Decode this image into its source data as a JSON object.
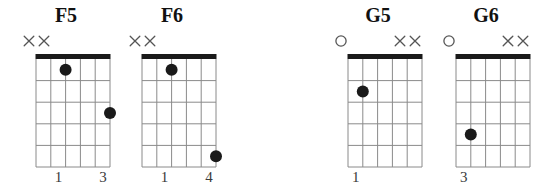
{
  "chart_data": {
    "type": "table",
    "instrument": "guitar",
    "string_count": 6,
    "fret_count": 5,
    "legend": {
      "x_marker": "string not played (muted)",
      "o_marker": "open string",
      "dot": "fretted note",
      "nut": "thick bar indicates open position nut"
    },
    "colors": {
      "nut": "#1a1a1a",
      "grid": "#8a8a8a",
      "dot": "#1a1a1a",
      "marker": "#555555",
      "title": "#111111",
      "background": "#ffffff"
    },
    "chords": [
      {
        "name": "F5",
        "markers": [
          "x",
          "x",
          "",
          "",
          "",
          ""
        ],
        "dots": [
          {
            "string": 3,
            "fret": 1
          },
          {
            "string": 6,
            "fret": 3
          }
        ],
        "fingers": [
          {
            "string": 3,
            "label": "1"
          },
          {
            "string": 6,
            "label": "3"
          }
        ]
      },
      {
        "name": "F6",
        "markers": [
          "x",
          "x",
          "",
          "",
          "",
          ""
        ],
        "dots": [
          {
            "string": 3,
            "fret": 1
          },
          {
            "string": 6,
            "fret": 5
          }
        ],
        "fingers": [
          {
            "string": 3,
            "label": "1"
          },
          {
            "string": 6,
            "label": "4"
          }
        ]
      },
      {
        "name": "G5",
        "markers": [
          "o",
          "",
          "",
          "",
          "x",
          "x"
        ],
        "dots": [
          {
            "string": 2,
            "fret": 2
          }
        ],
        "fingers": [
          {
            "string": 2,
            "label": "1"
          }
        ]
      },
      {
        "name": "G6",
        "markers": [
          "o",
          "",
          "",
          "",
          "x",
          "x"
        ],
        "dots": [
          {
            "string": 2,
            "fret": 4
          }
        ],
        "fingers": [
          {
            "string": 2,
            "label": "3"
          }
        ]
      }
    ]
  },
  "layout": {
    "group_lefts": [
      18,
      124,
      330,
      438
    ],
    "group_width": 96,
    "board_left_inset": 11,
    "board_width": 74,
    "board_height": 113
  }
}
